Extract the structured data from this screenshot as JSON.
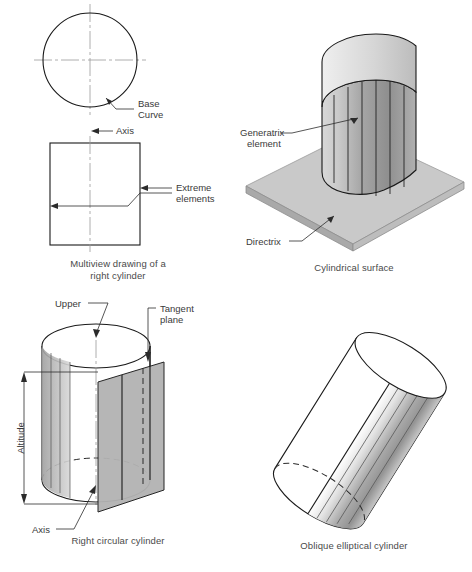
{
  "figure": {
    "background_color": "#ffffff",
    "line_color": "#1a1a1a",
    "text_color": "#3a3a3a",
    "shade_color": "#b8b8b8"
  },
  "panels": [
    {
      "id": "multiview",
      "caption_line1": "Multiview drawing of a",
      "caption_line2": "right cylinder",
      "labels": {
        "base_curve_line1": "Base",
        "base_curve_line2": "Curve",
        "axis": "Axis",
        "extreme_line1": "Extreme",
        "extreme_line2": "elements"
      }
    },
    {
      "id": "cylindrical-surface",
      "caption_line1": "Cylindrical surface",
      "caption_line2": "",
      "labels": {
        "generatrix_line1": "Generatrix",
        "generatrix_line2": "element",
        "directrix": "Directrix"
      }
    },
    {
      "id": "right-circular-cylinder",
      "caption_line1": "Right circular cylinder",
      "caption_line2": "",
      "labels": {
        "upper": "Upper",
        "tangent_line1": "Tangent",
        "tangent_line2": "plane",
        "altitude": "Altitude",
        "axis": "Axis"
      }
    },
    {
      "id": "oblique-elliptical-cylinder",
      "caption_line1": "Oblique elliptical cylinder",
      "caption_line2": "",
      "labels": {}
    }
  ]
}
